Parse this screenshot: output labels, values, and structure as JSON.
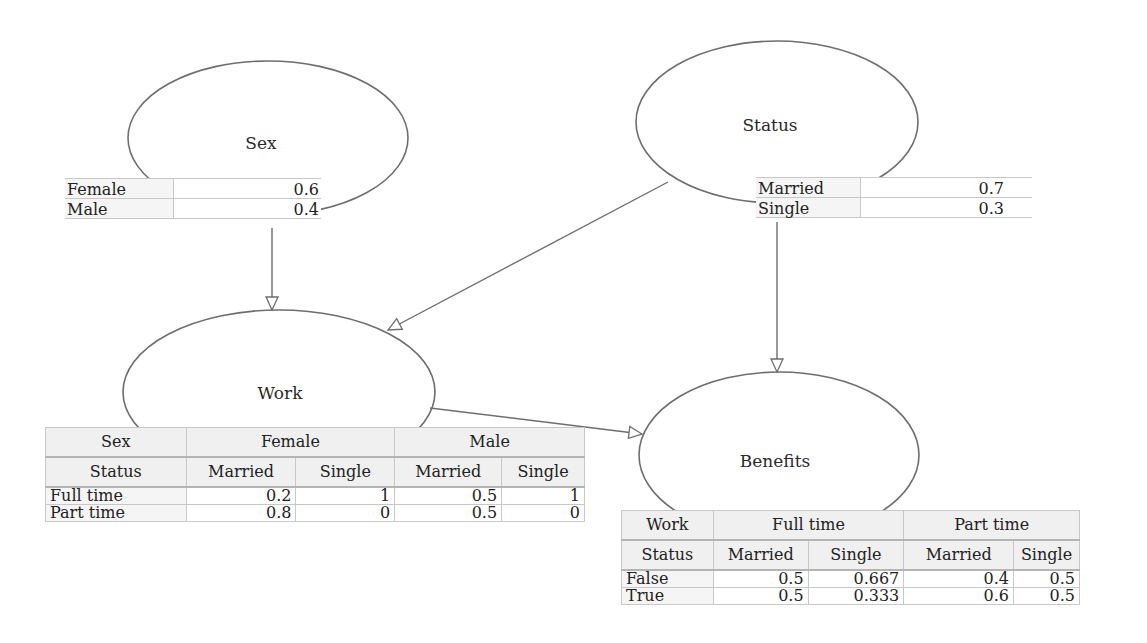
{
  "nodes": {
    "sex": {
      "label": "Sex",
      "cpt": {
        "rows": [
          {
            "state": "Female",
            "p": "0.6"
          },
          {
            "state": "Male",
            "p": "0.4"
          }
        ]
      }
    },
    "status": {
      "label": "Status",
      "cpt": {
        "rows": [
          {
            "state": "Married",
            "p": "0.7"
          },
          {
            "state": "Single",
            "p": "0.3"
          }
        ]
      }
    },
    "work": {
      "label": "Work",
      "cpt": {
        "parent1_name": "Sex",
        "parent1_values": [
          "Female",
          "Male"
        ],
        "parent2_name": "Status",
        "parent2_values": [
          "Married",
          "Single",
          "Married",
          "Single"
        ],
        "rows": [
          {
            "state": "Full time",
            "p": [
              "0.2",
              "1",
              "0.5",
              "1"
            ]
          },
          {
            "state": "Part time",
            "p": [
              "0.8",
              "0",
              "0.5",
              "0"
            ]
          }
        ]
      }
    },
    "benefits": {
      "label": "Benefits",
      "cpt": {
        "parent1_name": "Work",
        "parent1_values": [
          "Full time",
          "Part time"
        ],
        "parent2_name": "Status",
        "parent2_values": [
          "Married",
          "Single",
          "Married",
          "Single"
        ],
        "rows": [
          {
            "state": "False",
            "p": [
              "0.5",
              "0.667",
              "0.4",
              "0.5"
            ]
          },
          {
            "state": "True",
            "p": [
              "0.5",
              "0.333",
              "0.6",
              "0.5"
            ]
          }
        ]
      }
    }
  },
  "edges": [
    {
      "from": "Sex",
      "to": "Work"
    },
    {
      "from": "Status",
      "to": "Work"
    },
    {
      "from": "Status",
      "to": "Benefits"
    },
    {
      "from": "Work",
      "to": "Benefits"
    }
  ],
  "colors": {
    "stroke": "#6e6e6e",
    "grid": "#c8c8c8",
    "header_bg": "#f0f0f0"
  }
}
